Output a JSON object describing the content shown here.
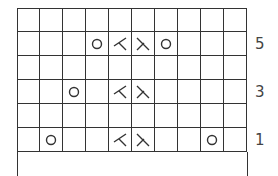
{
  "chart": {
    "columns": 10,
    "rows": [
      {
        "cells": [
          "",
          "",
          "",
          "",
          "",
          "",
          "",
          "",
          "",
          ""
        ],
        "label": ""
      },
      {
        "cells": [
          "",
          "",
          "",
          "yo",
          "k2tog",
          "ssk",
          "yo",
          "",
          "",
          ""
        ],
        "label": "5"
      },
      {
        "cells": [
          "",
          "",
          "",
          "",
          "",
          "",
          "",
          "",
          "",
          ""
        ],
        "label": ""
      },
      {
        "cells": [
          "",
          "",
          "yo",
          "",
          "k2tog",
          "ssk",
          "",
          "",
          "",
          ""
        ],
        "label": "3"
      },
      {
        "cells": [
          "",
          "",
          "",
          "",
          "",
          "",
          "",
          "",
          "",
          ""
        ],
        "label": ""
      },
      {
        "cells": [
          "",
          "yo",
          "",
          "",
          "k2tog",
          "ssk",
          "",
          "",
          "yo",
          ""
        ],
        "label": "1"
      }
    ]
  },
  "symbols": {
    "yo": "yarn-over-circle-icon",
    "k2tog": "k2tog-right-slant-icon",
    "ssk": "ssk-left-slant-icon"
  },
  "colors": {
    "line": "#333333",
    "background": "#ffffff"
  }
}
